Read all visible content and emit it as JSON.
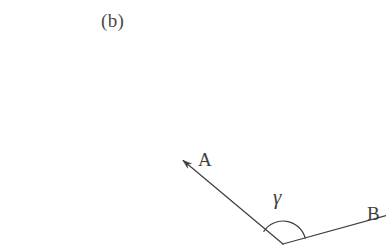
{
  "figure": {
    "subfigure_label": "(b)",
    "background_color": "#ffffff",
    "stroke_color": "#3f3f3f",
    "text_color": "#4a4a4a",
    "vectors": [
      {
        "name": "vector-a",
        "label": "A",
        "has_arrowhead": true,
        "direction": "up-left",
        "from": [
          283,
          244
        ],
        "to": [
          181,
          159
        ]
      },
      {
        "name": "vector-b",
        "label": "B",
        "has_arrowhead": false,
        "direction": "right",
        "from": [
          283,
          244
        ],
        "to": [
          386,
          216
        ]
      }
    ],
    "angle": {
      "label": "γ",
      "name": "gamma",
      "between": [
        "A",
        "B"
      ],
      "arc_radius": 23,
      "vertex": [
        283,
        244
      ]
    }
  }
}
